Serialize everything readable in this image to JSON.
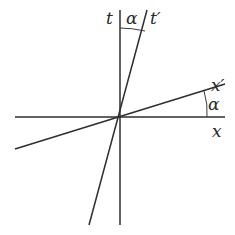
{
  "diagram": {
    "labels": {
      "t_axis": "t",
      "t_prime_axis": "t′",
      "x_axis": "x",
      "x_prime_axis": "x′",
      "angle_top": "α",
      "angle_right": "α"
    },
    "colors": {
      "line": "#2e2e2e",
      "text": "#2a2a2a",
      "background": "#ffffff"
    }
  }
}
